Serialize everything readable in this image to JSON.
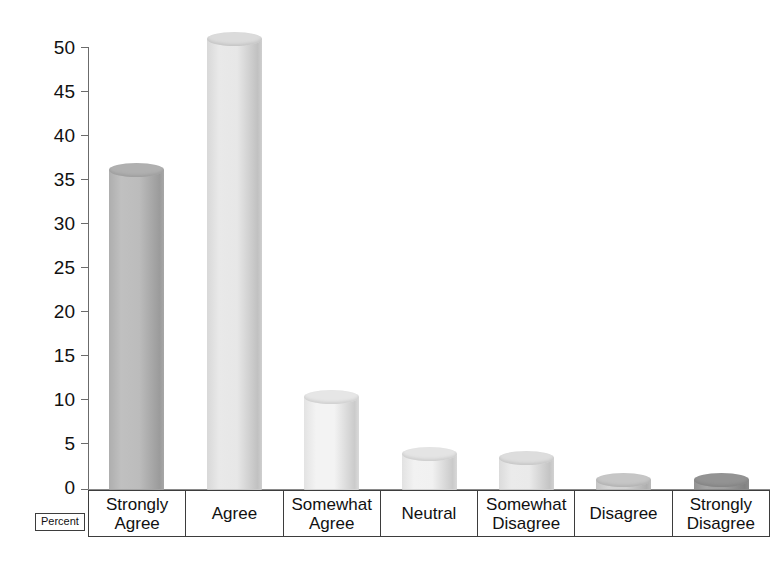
{
  "chart_data": {
    "type": "bar",
    "title": "",
    "subtitle": "",
    "xlabel": "",
    "ylabel": "Percent",
    "ylim": [
      0,
      52
    ],
    "grid": false,
    "legend": "none",
    "bar_style": "3d-cylinder",
    "categories": [
      "Strongly\nAgree",
      "Agree",
      "Somewhat\nAgree",
      "Neutral",
      "Somewhat\nDisagree",
      "Disagree",
      "Strongly\nDisagree"
    ],
    "values": [
      36.5,
      51.5,
      10.5,
      4,
      3.5,
      1,
      1
    ],
    "yticks": [
      0,
      5,
      10,
      15,
      20,
      25,
      30,
      35,
      40,
      45,
      50
    ],
    "ytick_labels": [
      "0",
      "5",
      "10",
      "15",
      "20",
      "25",
      "30",
      "35",
      "40",
      "45",
      "50"
    ],
    "bar_colors": [
      "#b9b9b9",
      "#e6e6e6",
      "#f2f2f2",
      "#f0f0f0",
      "#e9e9e9",
      "#d0d0d0",
      "#9b9b9b"
    ]
  },
  "axis": {
    "y_labels": [
      "50",
      "45",
      "40",
      "35",
      "30",
      "25",
      "20",
      "15",
      "10",
      "5",
      "0"
    ],
    "line_color": "#6b6b6b",
    "baseline_color": "#8a8a8a"
  },
  "categories": [
    {
      "line1": "Strongly",
      "line2": "Agree"
    },
    {
      "line1": "Agree",
      "line2": ""
    },
    {
      "line1": "Somewhat",
      "line2": "Agree"
    },
    {
      "line1": "Neutral",
      "line2": ""
    },
    {
      "line1": "Somewhat",
      "line2": "Disagree"
    },
    {
      "line1": "Disagree",
      "line2": ""
    },
    {
      "line1": "Strongly",
      "line2": "Disagree"
    }
  ],
  "legend": {
    "percent_label": "Percent"
  }
}
